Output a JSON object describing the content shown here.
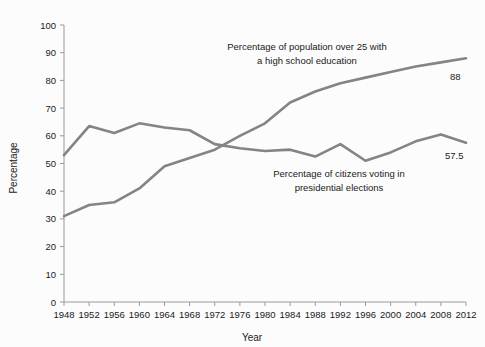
{
  "chart_data": {
    "type": "line",
    "title": "",
    "xlabel": "Year",
    "ylabel": "Percentage",
    "xlim": [
      1948,
      2012
    ],
    "ylim": [
      0,
      100
    ],
    "grid": false,
    "legend_position": "inline-annotations",
    "x": [
      1948,
      1952,
      1956,
      1960,
      1964,
      1968,
      1972,
      1976,
      1980,
      1984,
      1988,
      1992,
      1996,
      2000,
      2004,
      2008,
      2012
    ],
    "xticklabels": [
      "1948",
      "1952",
      "1956",
      "1960",
      "1964",
      "1968",
      "1972",
      "1976",
      "1980",
      "1984",
      "1988",
      "1992",
      "1996",
      "2000",
      "2004",
      "2008",
      "2012"
    ],
    "yticks": [
      0,
      10,
      20,
      30,
      40,
      50,
      60,
      70,
      80,
      90,
      100
    ],
    "yticklabels": [
      "0",
      "10",
      "20",
      "30",
      "40",
      "50",
      "60",
      "70",
      "80",
      "90",
      "100"
    ],
    "series": [
      {
        "name": "Percentage of population over 25 with a high school education",
        "annotation_line1": "Percentage of population over 25 with",
        "annotation_line2": "a high school education",
        "end_value_label": "88",
        "color": "#848484",
        "values": [
          31,
          35,
          36,
          41,
          49,
          52,
          55,
          60,
          64.5,
          72,
          76,
          79,
          81,
          83,
          85,
          86.5,
          88
        ]
      },
      {
        "name": "Percentage of citizens voting in presidential elections",
        "annotation_line1": "Percentage of citizens voting in",
        "annotation_line2": "presidential elections",
        "end_value_label": "57.5",
        "color": "#848484",
        "values": [
          53,
          63.5,
          61,
          64.5,
          63,
          62,
          57,
          55.5,
          54.5,
          55,
          52.5,
          57,
          51,
          54,
          58,
          60.5,
          57.5
        ]
      }
    ]
  },
  "axes": {
    "x_title": "Year",
    "y_title": "Percentage"
  },
  "colors": {
    "line": "#848484",
    "axis": "#9a9a9a",
    "text": "#1a1a1a",
    "background": "#fcfcfc"
  }
}
